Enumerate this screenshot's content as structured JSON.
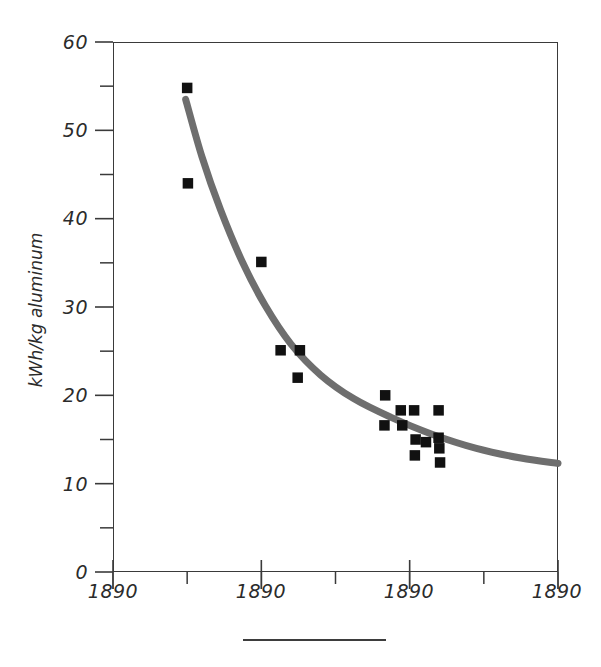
{
  "chart_data": {
    "type": "scatter",
    "title": "",
    "xlabel": "",
    "ylabel": "kWh/kg aluminum",
    "xlim": [
      0,
      6
    ],
    "ylim": [
      0,
      60
    ],
    "grid": false,
    "legend": null,
    "y_ticks": [
      0,
      10,
      20,
      30,
      40,
      50,
      60
    ],
    "y_tick_labels": [
      "0",
      "10",
      "20",
      "30",
      "40",
      "50",
      "60"
    ],
    "y_minor_ticks": [
      5,
      15,
      25,
      35,
      45,
      55
    ],
    "x_tick_positions": [
      0,
      1,
      2,
      3,
      4,
      5,
      6
    ],
    "x_labeled_positions": [
      0,
      2,
      4,
      6
    ],
    "x_tick_labels": [
      "1890",
      "1890",
      "1890",
      "1890"
    ],
    "series": [
      {
        "name": "observations",
        "marker": "square",
        "color": "#111111",
        "points": [
          {
            "x": 1.0,
            "y": 54.8
          },
          {
            "x": 1.01,
            "y": 44.0
          },
          {
            "x": 2.0,
            "y": 35.1
          },
          {
            "x": 2.26,
            "y": 25.1
          },
          {
            "x": 2.52,
            "y": 25.1
          },
          {
            "x": 2.49,
            "y": 22.0
          },
          {
            "x": 3.67,
            "y": 20.0
          },
          {
            "x": 3.88,
            "y": 18.3
          },
          {
            "x": 3.9,
            "y": 16.6
          },
          {
            "x": 3.66,
            "y": 16.6
          },
          {
            "x": 4.39,
            "y": 18.3
          },
          {
            "x": 4.39,
            "y": 15.2
          },
          {
            "x": 4.4,
            "y": 14.0
          },
          {
            "x": 4.41,
            "y": 12.4
          },
          {
            "x": 4.06,
            "y": 18.3
          },
          {
            "x": 4.08,
            "y": 15.0
          },
          {
            "x": 4.07,
            "y": 13.2
          },
          {
            "x": 4.22,
            "y": 14.7
          }
        ]
      }
    ],
    "fit_curve": {
      "name": "trend",
      "color": "#6e6e6e",
      "style": "solid",
      "width_px": 7,
      "points": [
        {
          "x": 0.98,
          "y": 53.5
        },
        {
          "x": 1.2,
          "y": 47.0
        },
        {
          "x": 1.45,
          "y": 41.0
        },
        {
          "x": 1.75,
          "y": 35.0
        },
        {
          "x": 2.05,
          "y": 30.2
        },
        {
          "x": 2.4,
          "y": 25.8
        },
        {
          "x": 2.8,
          "y": 22.3
        },
        {
          "x": 3.25,
          "y": 19.6
        },
        {
          "x": 3.75,
          "y": 17.5
        },
        {
          "x": 4.3,
          "y": 15.6
        },
        {
          "x": 4.9,
          "y": 14.0
        },
        {
          "x": 5.5,
          "y": 12.9
        },
        {
          "x": 6.0,
          "y": 12.3
        }
      ]
    }
  },
  "axes": {
    "y_title": "kWh/kg aluminum",
    "y_labels": {
      "t60": "60",
      "t50": "50",
      "t40": "40",
      "t30": "30",
      "t20": "20",
      "t10": "10",
      "t0": "0"
    },
    "x_labels": {
      "x0": "1890",
      "x1": "1890",
      "x2": "1890",
      "x3": "1890"
    }
  },
  "colors": {
    "axis": "#3a3a3a",
    "marker": "#111111",
    "curve": "#6e6e6e",
    "text": "#2b2b2b",
    "background": "#ffffff"
  },
  "caption": {
    "rule": ""
  }
}
